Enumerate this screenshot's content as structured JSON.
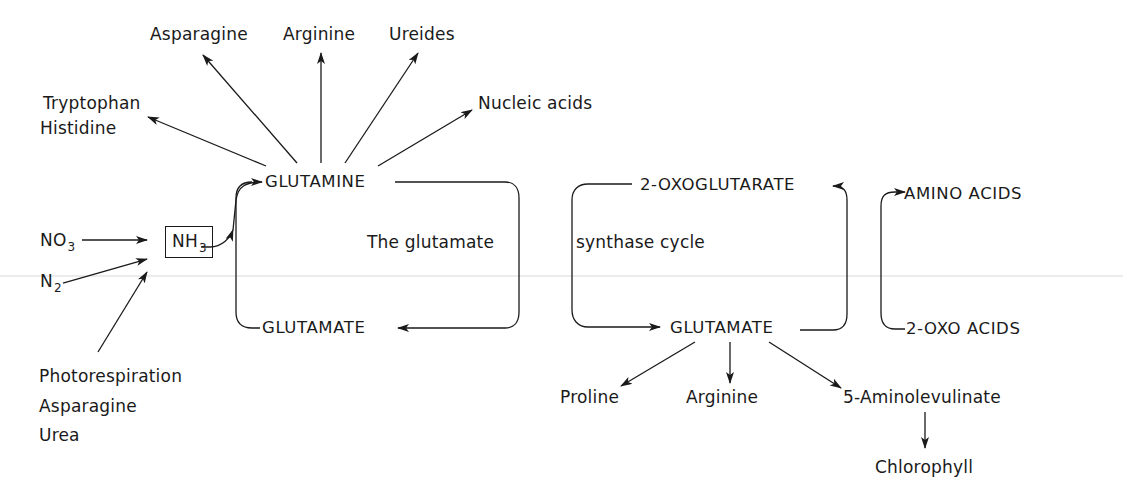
{
  "diagram": {
    "type": "metabolic-pathway",
    "inputs": {
      "no3": {
        "base": "NO",
        "sub": "3"
      },
      "n2": {
        "base": "N",
        "sub": "2"
      },
      "other_sources": [
        "Photorespiration",
        "Asparagine",
        "Urea"
      ]
    },
    "ammonia": {
      "base": "NH",
      "sub": "3"
    },
    "cycle_left": {
      "glutamine": "GLUTAMINE",
      "glutamate": "GLUTAMATE",
      "caption_left": "The glutamate"
    },
    "cycle_right": {
      "oxoglutarate": "2-OXOGLUTARATE",
      "glutamate": "GLUTAMATE",
      "caption_right": "synthase cycle"
    },
    "transamination": {
      "amino_acids": "AMINO ACIDS",
      "oxo_acids": "2-OXO ACIDS"
    },
    "glutamine_products": {
      "tryptophan": "Tryptophan",
      "histidine": "Histidine",
      "asparagine": "Asparagine",
      "arginine": "Arginine",
      "ureides": "Ureides",
      "nucleic_acids": "Nucleic acids"
    },
    "glutamate_products": {
      "proline": "Proline",
      "arginine": "Arginine",
      "aminolevulinate": "5-Aminolevulinate",
      "chlorophyll": "Chlorophyll"
    }
  }
}
